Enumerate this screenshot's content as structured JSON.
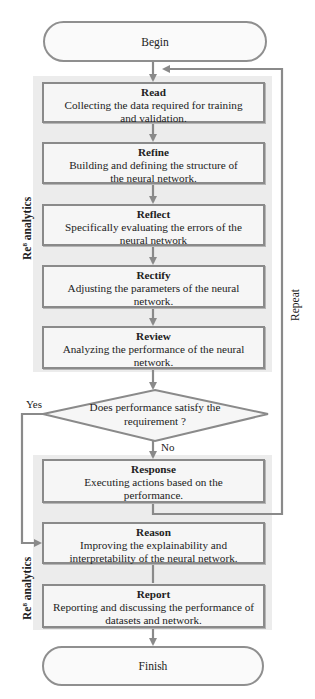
{
  "diagram": {
    "start": {
      "label": "Begin"
    },
    "end": {
      "label": "Finish"
    },
    "groups": [
      {
        "label_prefix": "Re",
        "label_sup": "8",
        "label_suffix": " analytics"
      },
      {
        "label_prefix": "Re",
        "label_sup": "8",
        "label_suffix": " analytics"
      }
    ],
    "steps": [
      {
        "title": "Read",
        "desc": "Collecting the data required for training and validation."
      },
      {
        "title": "Refine",
        "desc": "Building and defining the structure of the neural network."
      },
      {
        "title": "Reflect",
        "desc": "Specifically evaluating the errors of the neural network"
      },
      {
        "title": "Rectify",
        "desc": "Adjusting the parameters of the neural network."
      },
      {
        "title": "Review",
        "desc": "Analyzing the performance of the neural network."
      },
      {
        "title": "Response",
        "desc": "Executing actions based on the performance."
      },
      {
        "title": "Reason",
        "desc": "Improving the explainability and interpretability of the neural network."
      },
      {
        "title": "Report",
        "desc": "Reporting and discussing the performance of datasets and network."
      }
    ],
    "decision": {
      "question": "Does performance satisfy the requirement ?",
      "yes_label": "Yes",
      "no_label": "No"
    },
    "loop_label": "Repeat",
    "colors": {
      "panel": "#ececec",
      "box_fill": "#f6f6f6",
      "box_border": "#8a8a8a",
      "line": "#8a8a8a"
    }
  }
}
